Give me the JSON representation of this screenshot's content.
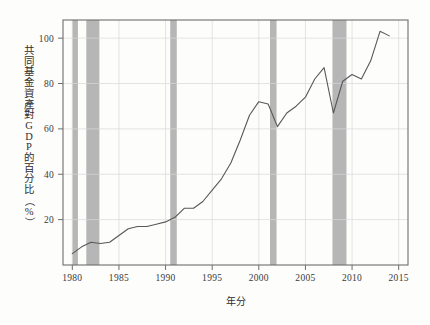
{
  "chart_data": {
    "type": "line",
    "title": "",
    "subtitle": "",
    "xlabel": "年分",
    "ylabel": "共同基金資產對GDP的百分比（%）",
    "ylabel_chars": [
      "共",
      "同",
      "基",
      "金",
      "資",
      "產",
      "對",
      "G",
      "D",
      "P",
      "的",
      "百",
      "分",
      "比",
      "（",
      "%",
      "）"
    ],
    "xlim": [
      1979,
      2016
    ],
    "ylim": [
      0,
      108
    ],
    "xticks": [
      1980,
      1985,
      1990,
      1995,
      2000,
      2005,
      2010,
      2015
    ],
    "xtick_labels": [
      "1980",
      "1985",
      "1990",
      "1995",
      "2000",
      "2005",
      "2010",
      "2015"
    ],
    "yticks": [
      20,
      40,
      60,
      80,
      100
    ],
    "ytick_labels": [
      "20",
      "40",
      "60",
      "80",
      "100"
    ],
    "grid": true,
    "grid_color": "#d8d8d8",
    "line_color": "#585858",
    "line_width": 1.1,
    "band_color": "#a9a9a9",
    "frame_color": "#6e6e6e",
    "background": "#fdfdfc",
    "legend": "none",
    "series": [
      {
        "name": "共同基金資產對GDP的百分比",
        "x": [
          1980,
          1981,
          1982,
          1983,
          1984,
          1985,
          1986,
          1987,
          1988,
          1989,
          1990,
          1991,
          1992,
          1993,
          1994,
          1995,
          1996,
          1997,
          1998,
          1999,
          2000,
          2001,
          2002,
          2003,
          2004,
          2005,
          2006,
          2007,
          2008,
          2009,
          2010,
          2011,
          2012,
          2013,
          2014
        ],
        "values": [
          5,
          8,
          10,
          9.5,
          10,
          13,
          16,
          17,
          17,
          18,
          19,
          21,
          25,
          25,
          28,
          33,
          38,
          45,
          55,
          66,
          72,
          71,
          61,
          67,
          70,
          74,
          82,
          87,
          67,
          81,
          84,
          82,
          90,
          103,
          101
        ]
      }
    ],
    "recession_bands": [
      {
        "start": 1980.0,
        "end": 1980.6
      },
      {
        "start": 1981.5,
        "end": 1982.9
      },
      {
        "start": 1990.5,
        "end": 1991.2
      },
      {
        "start": 2001.2,
        "end": 2001.9
      },
      {
        "start": 2007.9,
        "end": 2009.4
      }
    ]
  }
}
